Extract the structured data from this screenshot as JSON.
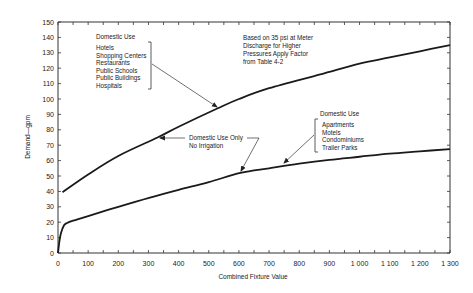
{
  "chart_data": {
    "type": "line",
    "title": "",
    "xlabel": "Combined Fixture Value",
    "ylabel": "Demand—gpm",
    "xlim": [
      0,
      1300
    ],
    "ylim": [
      0,
      150
    ],
    "x_ticks": [
      0,
      100,
      200,
      300,
      400,
      500,
      600,
      700,
      800,
      900,
      1000,
      1100,
      1200,
      1300
    ],
    "x_tick_labels": [
      "0",
      "100",
      "200",
      "300",
      "400",
      "500",
      "600",
      "700",
      "800",
      "900",
      "1 000",
      "1 100",
      "1 200",
      "1 300"
    ],
    "y_ticks": [
      0,
      10,
      20,
      30,
      40,
      50,
      60,
      70,
      80,
      90,
      100,
      110,
      120,
      130,
      140,
      150
    ],
    "grid": false,
    "legend": "none",
    "series": [
      {
        "name": "Domestic Use — Hotels, Shopping Centers, Restaurants, Public Schools, Public Buildings, Hospitals",
        "x": [
          15,
          100,
          200,
          330,
          400,
          530,
          600,
          700,
          870,
          1000,
          1100,
          1200,
          1300
        ],
        "y": [
          39.5,
          51,
          63,
          75,
          82,
          94,
          100,
          107,
          116,
          123,
          127,
          131,
          135
        ]
      },
      {
        "name": "Domestic Use — Apartments, Motels, Condominiums, Trailer Parks (Domestic Use Only, No Irrigation)",
        "x": [
          0,
          5,
          10,
          20,
          30,
          50,
          100,
          200,
          305,
          400,
          500,
          605,
          700,
          800,
          900,
          1000,
          1100,
          1200,
          1300
        ],
        "y": [
          0,
          8,
          13,
          18,
          19.5,
          21,
          24,
          30,
          36,
          41,
          46,
          52,
          55,
          58,
          60.5,
          62.5,
          64.5,
          66,
          67.5
        ]
      }
    ],
    "annotations": [
      {
        "text": "Domestic Use",
        "items": [
          "Hotels",
          "Shopping Centers",
          "Restaurants",
          "Public Schools",
          "Public Buildings",
          "Hospitals"
        ],
        "points_to": {
          "x": 530,
          "y": 94
        }
      },
      {
        "text": "Based on 35 psi at Meter Discharge for Higher Pressures Apply Factor from Table 4-2"
      },
      {
        "text": "Domestic Use Only No Irrigation",
        "points_to": [
          {
            "x": 330,
            "y": 75
          },
          {
            "x": 605,
            "y": 52
          }
        ]
      },
      {
        "text": "Domestic Use",
        "items": [
          "Apartments",
          "Motels",
          "Condominiums",
          "Trailer Parks"
        ],
        "points_to": {
          "x": 740,
          "y": 57
        }
      }
    ]
  },
  "labels": {
    "xlabel": "Combined Fixture Value",
    "ylabel": "Demand—gpm",
    "upper_group_title": "Domestic Use",
    "upper_group_items": [
      "Hotels",
      "Shopping Centers",
      "Restaurants",
      "Public Schools",
      "Public Buildings",
      "Hospitals"
    ],
    "note_lines": [
      "Based on 35 psi at Meter",
      "Discharge for Higher",
      "Pressures Apply Factor",
      "from Table 4-2"
    ],
    "middle_line1": "Domestic Use Only",
    "middle_line2": "No Irrigation",
    "lower_group_title": "Domestic Use",
    "lower_group_items": [
      "Apartments",
      "Motels",
      "Condominiums",
      "Trailer Parks"
    ]
  },
  "colors": {
    "line": "#1a1a1a",
    "axis": "#333333",
    "text": "#222222"
  }
}
